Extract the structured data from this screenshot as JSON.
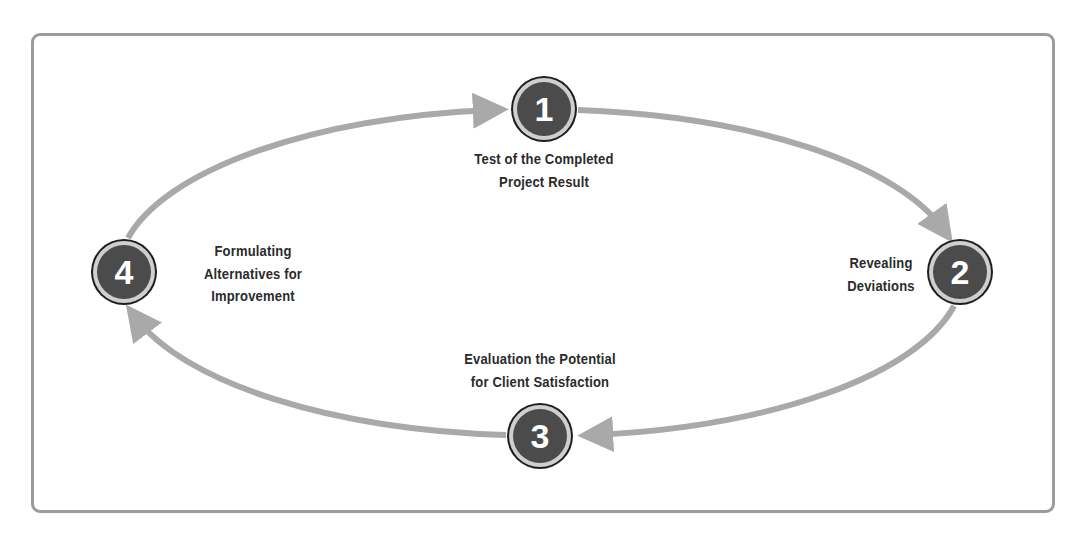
{
  "diagram": {
    "type": "cycle",
    "colors": {
      "arrow": "#a9a9a9",
      "node_fill": "#4b4b4b",
      "node_ring": "#cfcfcf",
      "node_border": "#1e1e1e",
      "node_text": "#ffffff",
      "label_text": "#2b2b2b",
      "frame": "#9b9b9b"
    },
    "steps": [
      {
        "number": "1",
        "label_lines": [
          "Test of the Completed",
          "Project Result"
        ]
      },
      {
        "number": "2",
        "label_lines": [
          "Revealing",
          "Deviations"
        ]
      },
      {
        "number": "3",
        "label_lines": [
          "Evaluation the Potential",
          "for Client Satisfaction"
        ]
      },
      {
        "number": "4",
        "label_lines": [
          "Formulating",
          "Alternatives for",
          "Improvement"
        ]
      }
    ],
    "flow": [
      "4 -> 1",
      "1 -> 2",
      "2 -> 3",
      "3 -> 4"
    ]
  }
}
